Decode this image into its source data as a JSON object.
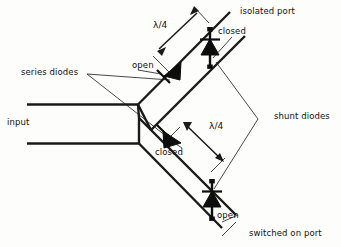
{
  "figure": {
    "type": "schematic-diagram",
    "background_color": "#fdfdfb",
    "line_color": "#1a1a1a"
  },
  "labels": {
    "input": "input",
    "series_diodes": "series diodes",
    "shunt_diodes": "shunt diodes",
    "isolated_port": "isolated port",
    "switched_on_port": "switched on port",
    "open_upper": "open",
    "closed_upper": "closed",
    "closed_lower": "closed",
    "open_lower": "open",
    "quarter_wave_upper": "λ/4",
    "quarter_wave_lower": "λ/4"
  },
  "components": {
    "series_diode_upper": {
      "name": "series-diode-upper",
      "state": "open",
      "orientation": "inline-on-upper-arm"
    },
    "series_diode_lower": {
      "name": "series-diode-lower",
      "state": "closed",
      "orientation": "inline-on-lower-arm"
    },
    "shunt_diode_upper": {
      "name": "shunt-diode-upper",
      "state": "closed",
      "orientation": "vertical-across-upper-arm"
    },
    "shunt_diode_lower": {
      "name": "shunt-diode-lower",
      "state": "open",
      "orientation": "vertical-across-lower-arm"
    }
  },
  "dimensions": {
    "upper_quarter_wave": "λ/4",
    "lower_quarter_wave": "λ/4"
  }
}
